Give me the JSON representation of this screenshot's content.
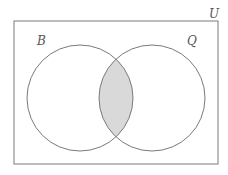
{
  "diagram": {
    "type": "venn",
    "universe": {
      "label": "U",
      "rect": {
        "x": 14,
        "y": 21,
        "width": 204,
        "height": 143
      }
    },
    "sets": [
      {
        "label": "B",
        "cx": 80,
        "cy": 98,
        "r": 53
      },
      {
        "label": "Q",
        "cx": 152,
        "cy": 98,
        "r": 53
      }
    ],
    "shaded_region": "B ∩ Q",
    "colors": {
      "stroke": "#7a7a7a",
      "shade": "#d9d9d9",
      "background": "#ffffff"
    }
  }
}
